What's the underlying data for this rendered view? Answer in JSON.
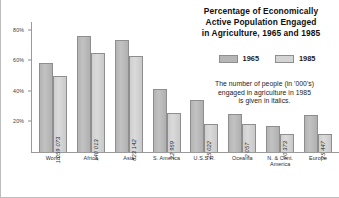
{
  "chart_data": {
    "type": "bar",
    "title": "Percentage of Economically Active Population Engaged in Agriculture, 1965 and 1985",
    "title_lines": [
      "Percentage of Economically",
      "Active Population Engaged",
      "in Agriculture, 1965 and 1985"
    ],
    "note_lines": [
      "The number of people (in '000's)",
      "engaged in agriculture in 1985",
      "is given in italics."
    ],
    "xlabel": "",
    "ylabel": "",
    "ylim": [
      0,
      85
    ],
    "yticks": [
      20,
      40,
      60,
      80
    ],
    "ytick_labels": [
      "20%",
      "40%",
      "60%",
      "80%"
    ],
    "grid": false,
    "legend_position": "right-panel",
    "categories": [
      "World",
      "Africa",
      "Asia",
      "S. America",
      "U.S.S.R.",
      "Oceania",
      "N. & Cent. America",
      "Europe"
    ],
    "category_lines": [
      [
        "World"
      ],
      [
        "Africa"
      ],
      [
        "Asia"
      ],
      [
        "S. America"
      ],
      [
        "U.S.S.R."
      ],
      [
        "Oceania"
      ],
      [
        "N. & Cent.",
        "America"
      ],
      [
        "Europe"
      ]
    ],
    "series": [
      {
        "name": "1965",
        "color": "#b6b6b6",
        "values": [
          58.5,
          76.0,
          73.5,
          41.0,
          34.0,
          25.0,
          17.0,
          24.0
        ]
      },
      {
        "name": "1985",
        "color": "#d4d4d4",
        "values": [
          49.5,
          65.0,
          63.0,
          25.5,
          18.5,
          18.5,
          12.0,
          11.5
        ]
      }
    ],
    "point_labels_1985_thousands": [
      "1 059 073",
      "140 013",
      "823 142",
      "22 959",
      "25 022",
      "2 057",
      "20 373",
      "25 447"
    ]
  },
  "legend": {
    "items": [
      {
        "label": "1965",
        "color": "#b6b6b6"
      },
      {
        "label": "1985",
        "color": "#d4d4d4"
      }
    ]
  }
}
